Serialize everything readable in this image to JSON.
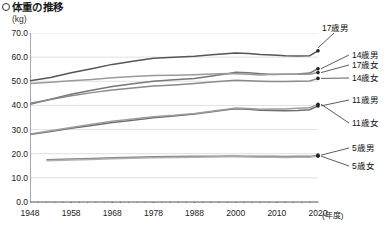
{
  "title": "体重の推移",
  "title_bullet": "circle-outline-icon",
  "unit_label": "(kg)",
  "x_unit_label": "(年度)",
  "chart_data": {
    "type": "line",
    "title": "体重の推移",
    "xlabel": "(年度)",
    "ylabel": "(kg)",
    "xlim": [
      1948,
      2020
    ],
    "ylim": [
      0.0,
      70.0
    ],
    "grid": true,
    "legend_position": "right-callouts",
    "ytick_labels": [
      "70.0",
      "60.0",
      "50.0",
      "40.0",
      "30.0",
      "20.0",
      "10.0",
      "0.0"
    ],
    "yticks": [
      70.0,
      60.0,
      50.0,
      40.0,
      30.0,
      20.0,
      10.0,
      0.0
    ],
    "xtick_labels": [
      "1948",
      "1958",
      "1968",
      "1978",
      "1988",
      "2000",
      "2010",
      "2020"
    ],
    "xticks": [
      1948,
      1958,
      1968,
      1978,
      1988,
      2000,
      2010,
      2020
    ],
    "series": [
      {
        "name": "17歳男",
        "color": "#555555",
        "x": [
          1948,
          1953,
          1958,
          1963,
          1968,
          1973,
          1978,
          1983,
          1988,
          1993,
          1998,
          2000,
          2003,
          2006,
          2009,
          2012,
          2015,
          2018,
          2020
        ],
        "values": [
          50.2,
          51.6,
          53.5,
          55.2,
          57.0,
          58.3,
          59.5,
          60.0,
          60.4,
          61.0,
          61.5,
          61.7,
          61.5,
          61.1,
          60.9,
          60.6,
          60.5,
          60.6,
          62.6
        ]
      },
      {
        "name": "14歳男",
        "color": "#777777",
        "x": [
          1948,
          1953,
          1958,
          1963,
          1968,
          1973,
          1978,
          1983,
          1988,
          1993,
          1998,
          2000,
          2003,
          2006,
          2009,
          2012,
          2015,
          2018,
          2020
        ],
        "values": [
          40.5,
          42.6,
          44.6,
          46.3,
          47.8,
          49.0,
          50.0,
          50.6,
          51.2,
          52.2,
          53.2,
          53.7,
          53.5,
          53.1,
          52.8,
          52.9,
          53.0,
          53.4,
          55.2
        ]
      },
      {
        "name": "17歳女",
        "color": "#9a9a9a",
        "x": [
          1948,
          1953,
          1958,
          1963,
          1968,
          1973,
          1978,
          1983,
          1988,
          1993,
          1998,
          2000,
          2003,
          2006,
          2009,
          2012,
          2015,
          2018,
          2020
        ],
        "values": [
          49.1,
          49.6,
          50.2,
          50.7,
          51.5,
          52.0,
          52.4,
          52.5,
          52.7,
          53.0,
          53.2,
          53.1,
          52.9,
          52.6,
          52.9,
          52.9,
          52.9,
          52.9,
          53.6
        ]
      },
      {
        "name": "14歳女",
        "color": "#8a8a8a",
        "x": [
          1948,
          1953,
          1958,
          1963,
          1968,
          1973,
          1978,
          1983,
          1988,
          1993,
          1998,
          2000,
          2003,
          2006,
          2009,
          2012,
          2015,
          2018,
          2020
        ],
        "values": [
          40.9,
          42.5,
          44.0,
          45.3,
          46.4,
          47.2,
          48.0,
          48.5,
          49.1,
          49.7,
          50.2,
          50.4,
          50.2,
          50.0,
          49.9,
          49.9,
          50.0,
          50.1,
          51.2
        ]
      },
      {
        "name": "11歳男",
        "color": "#6d6d6d",
        "x": [
          1948,
          1953,
          1958,
          1963,
          1968,
          1973,
          1978,
          1983,
          1988,
          1993,
          1998,
          2000,
          2003,
          2006,
          2009,
          2012,
          2015,
          2018,
          2020
        ],
        "values": [
          28.0,
          29.2,
          30.5,
          31.7,
          32.9,
          33.9,
          34.9,
          35.6,
          36.4,
          37.4,
          38.3,
          38.6,
          38.4,
          38.0,
          37.9,
          37.8,
          37.9,
          38.2,
          39.8
        ]
      },
      {
        "name": "11歳女",
        "color": "#9e9e9e",
        "x": [
          1948,
          1953,
          1958,
          1963,
          1968,
          1973,
          1978,
          1983,
          1988,
          1993,
          1998,
          2000,
          2003,
          2006,
          2009,
          2012,
          2015,
          2018,
          2020
        ],
        "values": [
          28.2,
          29.5,
          30.9,
          32.2,
          33.4,
          34.4,
          35.3,
          35.9,
          36.7,
          37.6,
          38.5,
          38.9,
          38.7,
          38.4,
          38.5,
          38.5,
          38.8,
          39.0,
          40.5
        ]
      },
      {
        "name": "5歳男",
        "color": "#888888",
        "x": [
          1952,
          1958,
          1963,
          1968,
          1973,
          1978,
          1983,
          1988,
          1993,
          1998,
          2000,
          2003,
          2006,
          2009,
          2012,
          2015,
          2018,
          2020
        ],
        "values": [
          17.5,
          17.8,
          18.0,
          18.3,
          18.5,
          18.7,
          18.8,
          18.9,
          19.0,
          19.1,
          19.1,
          19.0,
          18.9,
          18.9,
          18.8,
          18.9,
          18.9,
          19.4
        ]
      },
      {
        "name": "5歳女",
        "color": "#b0b0b0",
        "x": [
          1952,
          1958,
          1963,
          1968,
          1973,
          1978,
          1983,
          1988,
          1993,
          1998,
          2000,
          2003,
          2006,
          2009,
          2012,
          2015,
          2018,
          2020
        ],
        "values": [
          17.1,
          17.4,
          17.6,
          17.9,
          18.1,
          18.3,
          18.4,
          18.5,
          18.6,
          18.7,
          18.7,
          18.6,
          18.5,
          18.5,
          18.4,
          18.5,
          18.5,
          19.0
        ]
      }
    ],
    "callouts": [
      {
        "name": "17歳男"
      },
      {
        "name": "14歳男"
      },
      {
        "name": "17歳女"
      },
      {
        "name": "14歳女"
      },
      {
        "name": "11歳男"
      },
      {
        "name": "11歳女"
      },
      {
        "name": "5歳男"
      },
      {
        "name": "5歳女"
      }
    ]
  }
}
